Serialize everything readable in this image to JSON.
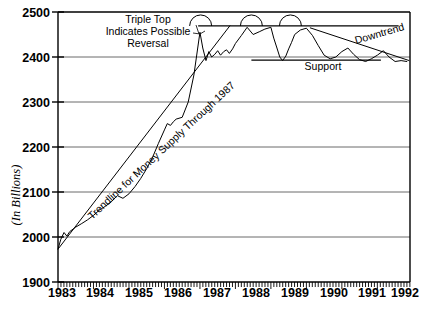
{
  "chart_data": {
    "type": "line",
    "title": "",
    "xlabel": "",
    "ylabel": "(In Billions)",
    "xlim": [
      1983,
      1992.92
    ],
    "ylim": [
      1900,
      2500
    ],
    "grid": true,
    "legend_position": "none",
    "y_ticks": [
      "2500",
      "2400",
      "2300",
      "2200",
      "2100",
      "2000",
      "1900"
    ],
    "y_tick_values": [
      2500,
      2400,
      2300,
      2200,
      2100,
      2000,
      1900
    ],
    "x_ticks": [
      "1983",
      "1984",
      "1985",
      "1986",
      "1987",
      "1988",
      "1989",
      "1990",
      "1991",
      "1992"
    ],
    "x_tick_values": [
      1983,
      1984,
      1985,
      1986,
      1987,
      1988,
      1989,
      1990,
      1991,
      1992
    ],
    "x_minor_ticks_per_year": 12,
    "series": [
      {
        "name": "Money Supply",
        "x": [
          1983.0,
          1983.08,
          1983.17,
          1983.25,
          1983.33,
          1983.5,
          1983.67,
          1983.83,
          1984.0,
          1984.17,
          1984.33,
          1984.5,
          1984.67,
          1984.83,
          1985.0,
          1985.17,
          1985.33,
          1985.5,
          1985.67,
          1985.83,
          1986.0,
          1986.08,
          1986.17,
          1986.25,
          1986.33,
          1986.5,
          1986.67,
          1986.83,
          1987.0,
          1987.08,
          1987.17,
          1987.25,
          1987.33,
          1987.42,
          1987.5,
          1987.58,
          1987.67,
          1987.75,
          1987.83,
          1987.92,
          1988.0,
          1988.17,
          1988.33,
          1988.5,
          1988.67,
          1988.83,
          1989.0,
          1989.08,
          1989.17,
          1989.25,
          1989.33,
          1989.42,
          1989.5,
          1989.58,
          1989.67,
          1989.83,
          1990.0,
          1990.17,
          1990.33,
          1990.5,
          1990.67,
          1990.83,
          1991.0,
          1991.17,
          1991.33,
          1991.5,
          1991.67,
          1991.83,
          1992.0,
          1992.17,
          1992.33,
          1992.5,
          1992.67,
          1992.83
        ],
        "y": [
          1973,
          1995,
          2010,
          2002,
          2012,
          2022,
          2030,
          2038,
          2048,
          2060,
          2068,
          2078,
          2092,
          2086,
          2096,
          2112,
          2130,
          2152,
          2178,
          2208,
          2238,
          2252,
          2248,
          2256,
          2262,
          2266,
          2300,
          2360,
          2455,
          2420,
          2392,
          2412,
          2400,
          2406,
          2414,
          2404,
          2412,
          2416,
          2408,
          2418,
          2430,
          2448,
          2466,
          2450,
          2456,
          2462,
          2466,
          2442,
          2420,
          2400,
          2392,
          2402,
          2418,
          2432,
          2450,
          2460,
          2464,
          2448,
          2426,
          2404,
          2396,
          2400,
          2412,
          2420,
          2406,
          2394,
          2390,
          2396,
          2404,
          2414,
          2400,
          2390,
          2392,
          2390
        ]
      }
    ],
    "annotations": [
      {
        "name": "triple-top-note",
        "text_lines": [
          "Triple Top",
          "Indicates Possible",
          "Reversal"
        ],
        "x_px": 148,
        "y_px": 22
      },
      {
        "name": "trendline-note",
        "text": "Trendline for Money Supply Through 1987",
        "rotation_deg": -43
      },
      {
        "name": "support-label",
        "text": "Support"
      },
      {
        "name": "downtrend-label",
        "text": "Downtrend",
        "rotation_deg": -14
      }
    ],
    "reference_lines": [
      {
        "name": "resistance-line",
        "label": "Resistance (Triple Top)",
        "y_value": 2469,
        "x_start": 1986.95,
        "x_end": 1992.6
      },
      {
        "name": "support-line",
        "label": "Support",
        "y_value": 2393,
        "x_start": 1988.45,
        "x_end": 1992.1
      },
      {
        "name": "downtrend-line",
        "label": "Downtrend",
        "x_start": 1990.1,
        "y_start": 2465,
        "x_end": 1992.9,
        "y_end": 2392
      },
      {
        "name": "trendline-1987",
        "label": "Trendline for Money Supply Through 1987",
        "x_start": 1983.0,
        "y_start": 1973,
        "x_end": 1987.85,
        "y_end": 2470
      }
    ],
    "top_markers": [
      {
        "name": "peak-1",
        "x": 1987.02,
        "y": 2469
      },
      {
        "name": "peak-2",
        "x": 1988.45,
        "y": 2469
      },
      {
        "name": "peak-3",
        "x": 1989.55,
        "y": 2469
      }
    ],
    "colors": {
      "line": "#000000",
      "grid": "#6b6b6b",
      "axis": "#000000",
      "background": "#ffffff"
    }
  },
  "axis": {
    "y_label": "(In Billions)"
  },
  "labels": {
    "triple_top_line1": "Triple Top",
    "triple_top_line2": "Indicates Possible",
    "triple_top_line3": "Reversal",
    "trendline": "Trendline for Money Supply Through 1987",
    "support": "Support",
    "downtrend": "Downtrend"
  }
}
